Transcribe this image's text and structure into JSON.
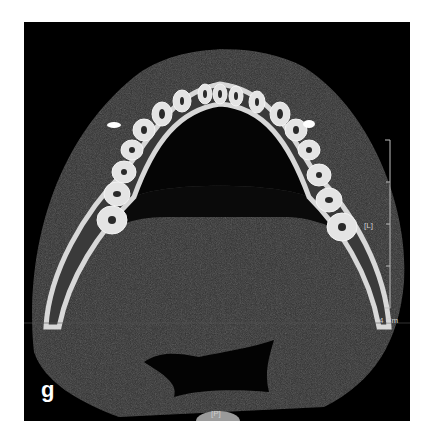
{
  "figure": {
    "panel_letter": "g",
    "orientation_left": "[L]",
    "orientation_posterior": "[P]",
    "scale_label": "4 Cm",
    "scale_ticks": 4
  },
  "colors": {
    "background": "#000000",
    "soft_tissue": "#2e2e2e",
    "bone": "#d8d8d8",
    "page": "#ffffff"
  }
}
